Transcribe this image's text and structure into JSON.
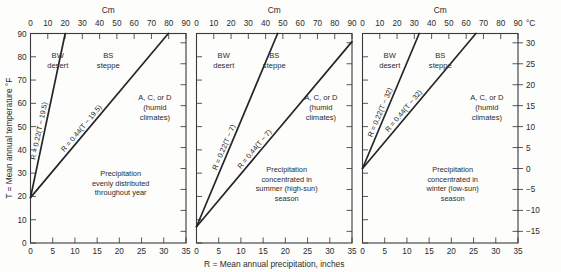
{
  "figure": {
    "top_axis_title": "Cm",
    "bottom_axis_title": "R = Mean annual precipitation, inches",
    "left_axis_title": "T = Mean annual temperature °F",
    "right_axis_title": "°C",
    "top_ticks": [
      "0",
      "10",
      "20",
      "30",
      "40",
      "50",
      "60",
      "70",
      "80",
      "90"
    ],
    "bottom_ticks": [
      "0",
      "5",
      "10",
      "15",
      "20",
      "25",
      "30",
      "35"
    ],
    "left_ticks": [
      "0",
      "10",
      "20",
      "30",
      "40",
      "50",
      "60",
      "70",
      "80",
      "90"
    ],
    "right_ticks": [
      "-15",
      "-10",
      "-5",
      "0",
      "5",
      "10",
      "15",
      "20",
      "25",
      "30"
    ],
    "line_color": "#262626",
    "frame_color": "#3a3a3a"
  },
  "panels": [
    {
      "id": "panel-even",
      "zone_bw": "BW",
      "zone_bw_sub": "desert",
      "zone_bs": "BS",
      "zone_bs_sub": "steppe",
      "zone_humid": "A, C, or D",
      "zone_humid_sub1": "(humid",
      "zone_humid_sub2": "climates)",
      "note_line1": "Precipitation",
      "note_line2": "evenly distributed",
      "note_line3": "throughout year",
      "note_line4": "",
      "eq_inner": "R = 0.22(T − 19.5)",
      "eq_outer": "R = 0.44(T − 19.5)",
      "intercept_T": 19.5,
      "slope_inner": 0.22,
      "slope_outer": 0.44
    },
    {
      "id": "panel-summer",
      "zone_bw": "BW",
      "zone_bw_sub": "desert",
      "zone_bs": "BS",
      "zone_bs_sub": "steppe",
      "zone_humid": "A, C, or D",
      "zone_humid_sub1": "(humid",
      "zone_humid_sub2": "climates)",
      "note_line1": "Precipitation",
      "note_line2": "concentrated in",
      "note_line3": "summer (high-sun)",
      "note_line4": "season",
      "eq_inner": "R = 0.22(T − 7)",
      "eq_outer": "R = 0.44(T − 7)",
      "intercept_T": 7,
      "slope_inner": 0.22,
      "slope_outer": 0.44
    },
    {
      "id": "panel-winter",
      "zone_bw": "BW",
      "zone_bw_sub": "desert",
      "zone_bs": "BS",
      "zone_bs_sub": "steppe",
      "zone_humid": "A, C, or D",
      "zone_humid_sub1": "(humid",
      "zone_humid_sub2": "climates)",
      "note_line1": "Precipitation",
      "note_line2": "concentrated in",
      "note_line3": "winter (low-sun)",
      "note_line4": "season",
      "eq_inner": "R = 0.22(T − 32)",
      "eq_outer": "R = 0.44(T − 32)",
      "intercept_T": 32,
      "slope_inner": 0.22,
      "slope_outer": 0.44
    }
  ],
  "chart_data": {
    "type": "line",
    "title": "",
    "xlabel": "R = Mean annual precipitation, inches",
    "ylabel": "T = Mean annual temperature °F",
    "xlim": [
      0,
      35
    ],
    "ylim": [
      0,
      90
    ],
    "top_xlabel": "Cm",
    "top_xlim": [
      0,
      90
    ],
    "right_ylabel": "°C",
    "right_ylim": [
      -17.8,
      32.2
    ],
    "grid": false,
    "legend": "none",
    "panels": [
      {
        "name": "Precipitation evenly distributed throughout year",
        "series": [
          {
            "name": "R = 0.22(T - 19.5)",
            "boundary": "BW desert / BS steppe",
            "x": [
              0,
              7.81
            ],
            "y": [
              19.5,
              90
            ]
          },
          {
            "name": "R = 0.44(T - 19.5)",
            "boundary": "BS steppe / A, C, or D humid",
            "x": [
              0,
              31.02
            ],
            "y": [
              19.5,
              90
            ]
          }
        ]
      },
      {
        "name": "Precipitation concentrated in summer (high-sun) season",
        "series": [
          {
            "name": "R = 0.22(T - 7)",
            "boundary": "BW desert / BS steppe",
            "x": [
              0,
              18.26
            ],
            "y": [
              7,
              90
            ]
          },
          {
            "name": "R = 0.44(T - 7)",
            "boundary": "BS steppe / A, C, or D humid",
            "x": [
              0,
              35.0
            ],
            "y": [
              7,
              86.5
            ]
          }
        ]
      },
      {
        "name": "Precipitation concentrated in winter (low-sun) season",
        "series": [
          {
            "name": "R = 0.22(T - 32)",
            "boundary": "BW desert / BS steppe",
            "x": [
              0,
              12.76
            ],
            "y": [
              32,
              90
            ]
          },
          {
            "name": "R = 0.44(T - 32)",
            "boundary": "BS steppe / A, C, or D humid",
            "x": [
              0,
              25.52
            ],
            "y": [
              32,
              90
            ]
          }
        ]
      }
    ]
  }
}
